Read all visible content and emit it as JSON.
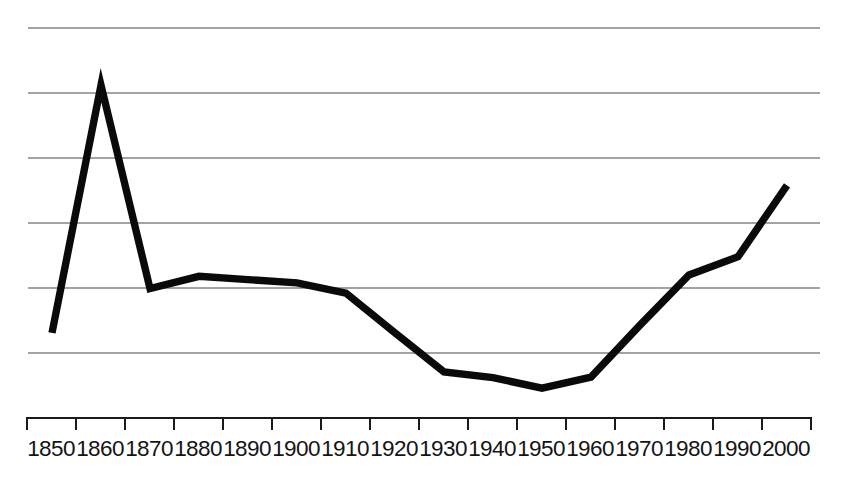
{
  "chart_data": {
    "type": "line",
    "title": "",
    "subtitle": "",
    "xlabel": "",
    "ylabel": "",
    "categories": [
      "1850",
      "1860",
      "1870",
      "1880",
      "1890",
      "1900",
      "1910",
      "1920",
      "1930",
      "1940",
      "1950",
      "1960",
      "1970",
      "1980",
      "1990",
      "2000"
    ],
    "x": [
      1850,
      1860,
      1870,
      1880,
      1890,
      1900,
      1910,
      1920,
      1930,
      1940,
      1950,
      1960,
      1970,
      1980,
      1990,
      2000
    ],
    "values": [
      1.31,
      5.12,
      1.99,
      2.18,
      2.13,
      2.08,
      1.92,
      1.31,
      0.71,
      0.62,
      0.46,
      0.63,
      1.43,
      2.2,
      2.48,
      3.58
    ],
    "series": [
      {
        "name": "series-1",
        "values": [
          1.31,
          5.12,
          1.99,
          2.18,
          2.13,
          2.08,
          1.92,
          1.31,
          0.71,
          0.62,
          0.46,
          0.63,
          1.43,
          2.2,
          2.48,
          3.58
        ]
      }
    ],
    "xlim": [
      1850,
      2000
    ],
    "ylim": [
      0,
      6
    ],
    "yticks": [
      1,
      2,
      3,
      4,
      5,
      6
    ],
    "ytick_labels": [
      "",
      "",
      "",
      "",
      "",
      ""
    ],
    "grid": "horizontal-only",
    "legend": "none",
    "line_color": "#0a0a0a",
    "gridline_color": "#a3a3a3",
    "axis_color": "#1a1a1a",
    "background_color": "#ffffff",
    "annotations": []
  },
  "axis": {
    "tick_labels": [
      "1850",
      "1860",
      "1870",
      "1880",
      "1890",
      "1900",
      "1910",
      "1920",
      "1930",
      "1940",
      "1950",
      "1960",
      "1970",
      "1980",
      "1990",
      "2000"
    ]
  }
}
